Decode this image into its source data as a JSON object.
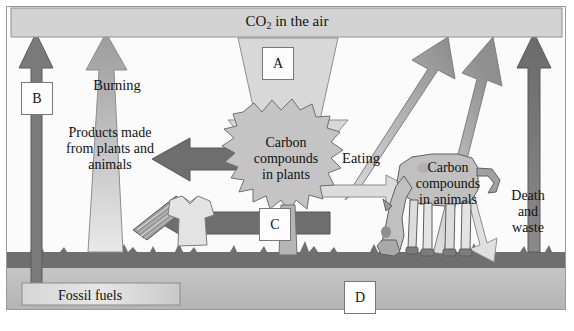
{
  "diagram": {
    "top_reservoir": {
      "label_prefix": "CO",
      "label_sub": "2",
      "label_suffix": " in the air"
    },
    "labels": {
      "burning": "Burning",
      "products": "Products made\nfrom plants and\nanimals",
      "products_line1": "Products made",
      "products_line2": "from plants and",
      "products_line3": "animals",
      "carbon_plants_line1": "Carbon",
      "carbon_plants_line2": "compounds",
      "carbon_plants_line3": "in plants",
      "eating": "Eating",
      "carbon_animals_line1": "Carbon",
      "carbon_animals_line2": "compounds",
      "carbon_animals_line3": "in animals",
      "death_line1": "Death",
      "death_line2": "and",
      "death_line3": "waste",
      "fossil_fuels": "Fossil fuels"
    },
    "question_boxes": [
      {
        "id": "A",
        "label": "A"
      },
      {
        "id": "B",
        "label": "B"
      },
      {
        "id": "C",
        "label": "C"
      },
      {
        "id": "D",
        "label": "D"
      }
    ],
    "colors": {
      "reservoir_bar": "#d3d3d3",
      "arrow_dark": "#6e6e6e",
      "arrow_light": "#d0d0d0",
      "arrow_mid": "#b3b3b3",
      "soil_dark": "#6f6f6f",
      "underground": "#bdbdbd",
      "sky": "#fbfbfb",
      "outline": "#444444",
      "box_border": "#777777"
    }
  }
}
